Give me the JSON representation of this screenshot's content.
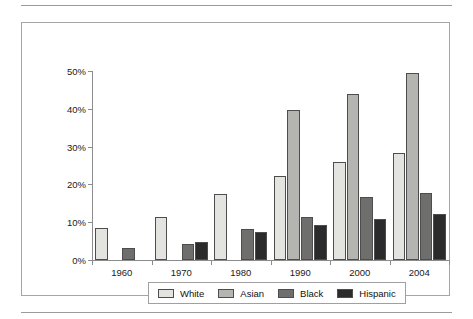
{
  "chart_data": {
    "type": "bar",
    "title": "",
    "subtitle": "",
    "xlabel": "",
    "ylabel": "",
    "categories": [
      "1960",
      "1970",
      "1980",
      "1990",
      "2000",
      "2004"
    ],
    "ylim": [
      0,
      50
    ],
    "ytick_labels": [
      "0%",
      "10%",
      "20%",
      "30%",
      "40%",
      "50%"
    ],
    "ytick_values": [
      0,
      10,
      20,
      30,
      40,
      50
    ],
    "grid": false,
    "legend_position": "bottom",
    "series": [
      {
        "name": "White",
        "color": "#e3e3e0",
        "values": [
          8.5,
          11.3,
          17.4,
          22.2,
          26.0,
          28.4
        ]
      },
      {
        "name": "Asian",
        "color": "#b4b4b1",
        "values": [
          null,
          null,
          null,
          39.8,
          44.0,
          49.6
        ]
      },
      {
        "name": "Black",
        "color": "#6e6e6c",
        "values": [
          3.2,
          4.3,
          8.3,
          11.5,
          16.6,
          17.8
        ]
      },
      {
        "name": "Hispanic",
        "color": "#2b2b2b",
        "values": [
          null,
          4.7,
          7.5,
          9.2,
          10.8,
          12.3
        ]
      }
    ]
  },
  "figure": {
    "frame_border_color": "#a6a6a6",
    "axis_color": "#8c8c8c",
    "bar_outline_color": "#4d4d4d",
    "background": "#ffffff"
  }
}
